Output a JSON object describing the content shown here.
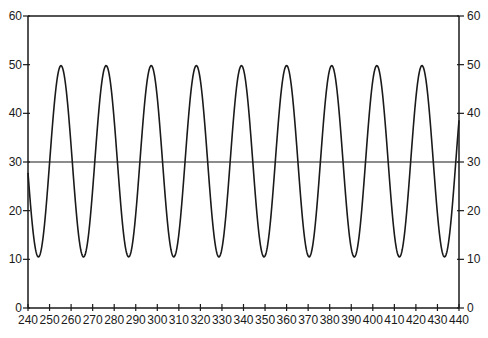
{
  "chart_data": {
    "type": "line",
    "title": "",
    "xlabel": "",
    "ylabel": "",
    "xlim": [
      240,
      440
    ],
    "ylim": [
      0,
      60
    ],
    "grid": false,
    "legend": null,
    "x_ticks": [
      240,
      250,
      260,
      270,
      280,
      290,
      300,
      310,
      320,
      330,
      340,
      350,
      360,
      370,
      380,
      390,
      400,
      410,
      420,
      430,
      440
    ],
    "y_ticks_left": [
      0,
      10,
      20,
      30,
      40,
      50,
      60
    ],
    "y_ticks_right": [
      0,
      10,
      20,
      30,
      40,
      50,
      60
    ],
    "reference_lines": [
      {
        "orientation": "horizontal",
        "y": 30
      }
    ],
    "series": [
      {
        "name": "oscillation",
        "shape": "sinusoid",
        "mean": 30.15,
        "amplitude": 19.65,
        "period": 20.94,
        "first_peak_x": 255.3,
        "peaks_x": [
          255.3,
          276.2,
          297.1,
          318.1,
          339.0,
          360.0,
          380.9,
          401.8,
          422.8
        ],
        "troughs_x": [
          244.8,
          265.8,
          286.7,
          307.6,
          328.6,
          349.5,
          370.4,
          391.4,
          412.3,
          433.2
        ],
        "peak_value": 49.8,
        "trough_value": 10.5,
        "x": [
          240,
          245,
          250,
          255,
          260,
          265,
          270,
          275,
          280,
          285,
          290,
          295,
          300,
          305,
          310,
          315,
          320,
          325,
          330,
          335,
          340,
          345,
          350,
          355,
          360,
          365,
          370,
          375,
          380,
          385,
          390,
          395,
          400,
          405,
          410,
          415,
          420,
          425,
          430,
          435,
          440
        ],
        "values": [
          27.8,
          10.5,
          22.2,
          49.8,
          39.6,
          10.6,
          15.9,
          49.2,
          44.9,
          13.5,
          11.3,
          45.5,
          48.9,
          18.6,
          10.5,
          39.8,
          49.5,
          24.7,
          12.1,
          32.6,
          49.6,
          31.3,
          11.6,
          26.3,
          49.8,
          37.3,
          10.6,
          19.8,
          48.5,
          42.7,
          12.3,
          12.9,
          47.4,
          47.3,
          15.9,
          10.8,
          42.4,
          49.8,
          21.9,
          11.0,
          38.4
        ]
      }
    ]
  },
  "axes": {
    "x_tick_labels": [
      "240",
      "250",
      "260",
      "270",
      "280",
      "290",
      "300",
      "310",
      "320",
      "330",
      "340",
      "350",
      "360",
      "370",
      "380",
      "390",
      "400",
      "410",
      "420",
      "430",
      "440"
    ],
    "y_left_labels": [
      "0",
      "10",
      "20",
      "30",
      "40",
      "50",
      "60"
    ],
    "y_right_labels": [
      "0",
      "10",
      "20",
      "30",
      "40",
      "50",
      "60"
    ]
  },
  "style": {
    "line_color": "#1a1a1a",
    "axis_color": "#1a1a1a",
    "background": "#ffffff"
  }
}
